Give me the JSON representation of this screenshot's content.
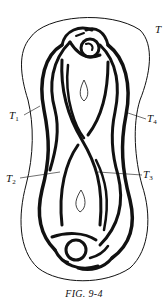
{
  "figure": {
    "caption": "FIG. 9-4",
    "labels": {
      "T": {
        "main": "T",
        "sub": ""
      },
      "T1": {
        "main": "T",
        "sub": "1"
      },
      "T2": {
        "main": "T",
        "sub": "2"
      },
      "T3": {
        "main": "T",
        "sub": "3"
      },
      "T4": {
        "main": "T",
        "sub": "4"
      }
    },
    "colors": {
      "ink": "#111111",
      "paper": "#ffffff"
    }
  }
}
